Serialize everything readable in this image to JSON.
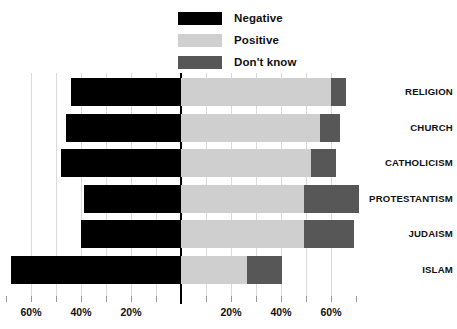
{
  "chart_data": {
    "type": "bar",
    "orientation": "horizontal",
    "layout": "diverging-stacked",
    "title": "",
    "subtitle": "",
    "xlabel": "",
    "ylabel": "",
    "grid": true,
    "legend_position": "top-center",
    "categories": [
      "RELIGION",
      "CHURCH",
      "CATHOLICISM",
      "PROTESTANTISM",
      "JUDAISM",
      "ISLAM"
    ],
    "series": [
      {
        "name": "Negative",
        "color": "#000000",
        "values": [
          44,
          46,
          48,
          39,
          40,
          68
        ]
      },
      {
        "name": "Positive",
        "color": "#cfcfcf",
        "values": [
          60,
          55.5,
          52,
          49,
          49,
          26.5
        ]
      },
      {
        "name": "Don't know",
        "color": "#575757",
        "values": [
          6,
          8,
          10,
          22,
          20,
          14
        ]
      }
    ],
    "xlim": [
      -70,
      70
    ],
    "x_tick_values": [
      -60,
      -40,
      -20,
      0,
      20,
      40,
      60
    ],
    "x_tick_labels": [
      "60%",
      "40%",
      "20%",
      "",
      "20%",
      "40%",
      "60%"
    ],
    "gridline_values": [
      -60,
      -50,
      -40,
      -30,
      -20,
      -10,
      10,
      20,
      30,
      40,
      50,
      60
    ],
    "axis_unit": "%"
  },
  "legend": {
    "items": [
      {
        "label": "Negative",
        "color": "#000000"
      },
      {
        "label": "Positive",
        "color": "#cfcfcf"
      },
      {
        "label": "Don't know",
        "color": "#575757"
      }
    ]
  },
  "axis": {
    "ticks": [
      {
        "label": "60%",
        "value": -60
      },
      {
        "label": "40%",
        "value": -40
      },
      {
        "label": "20%",
        "value": -20
      },
      {
        "label": "",
        "value": 0
      },
      {
        "label": "20%",
        "value": 20
      },
      {
        "label": "40%",
        "value": 40
      },
      {
        "label": "60%",
        "value": 60
      }
    ]
  }
}
